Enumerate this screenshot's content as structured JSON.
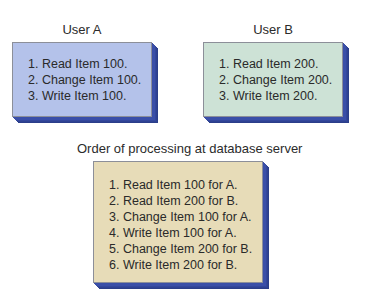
{
  "user_a": {
    "title": "User A",
    "fill_color": "#b4c2ea",
    "steps": [
      "1. Read Item 100.",
      "2. Change Item 100.",
      "3. Write Item 100."
    ]
  },
  "user_b": {
    "title": "User B",
    "fill_color": "#cde2d6",
    "steps": [
      "1. Read Item 200.",
      "2. Change Item 200.",
      "3. Write Item 200."
    ]
  },
  "server": {
    "title": "Order of processing at database server",
    "fill_color": "#e7dcb8",
    "steps": [
      "1. Read Item 100 for A.",
      "2. Read Item 200 for B.",
      "3. Change Item 100 for A.",
      "4. Write Item 100 for A.",
      "5. Change Item 200 for B.",
      "6. Write Item 200 for B."
    ]
  },
  "colors": {
    "box_extrusion": "#3a4fa8",
    "box_border": "#8c8f99",
    "text": "#2a2a2a"
  }
}
